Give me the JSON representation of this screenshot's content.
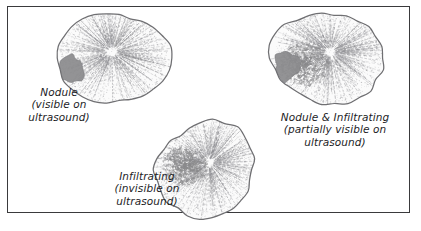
{
  "figure": {
    "title": "",
    "background_color": "#ffffff",
    "frame_color": "#3a3a3c",
    "outline_color": "#6f6f72",
    "fill_color": "#fbfbfb",
    "texture_color": "#8e8e92",
    "nodule_color": "#8a8a8c",
    "text_color": "#1d1d1f"
  },
  "specimens": [
    {
      "id": "nodule",
      "pattern": "solid-nodule",
      "nodule_position": "left-edge",
      "label": {
        "lines": [
          "Nodule",
          "(visible on",
          "ultrasound)"
        ]
      }
    },
    {
      "id": "infiltrating",
      "pattern": "diffuse-speckle",
      "nodule_position": "left-center",
      "label": {
        "lines": [
          "Infiltrating",
          "(invisible on",
          "ultrasound)"
        ]
      }
    },
    {
      "id": "nodule-and-infiltrating",
      "pattern": "solid-nodule-with-speckle",
      "nodule_position": "left-edge",
      "label": {
        "lines": [
          "Nodule & Infiltrating",
          "(partially visible on",
          "ultrasound)"
        ]
      }
    }
  ]
}
